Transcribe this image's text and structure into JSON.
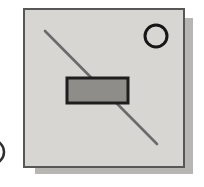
{
  "page": {
    "width": 204,
    "height": 187,
    "background_color": "#ffffff"
  },
  "icon": {
    "name": "component-symbol-icon",
    "description": "Light gray square tile with drop shadow containing a diagonal slash line, a centered dark-bordered filled rectangle, and a small outlined circle in the top-right corner; a partial arc of an adjacent glyph is clipped at the left edge of the crop",
    "tile": {
      "x": 23,
      "y": 8,
      "width": 162,
      "height": 160,
      "fill": "#d7d6d3",
      "border_color": "#575757",
      "border_width": 2.5,
      "shadow_color": "#b7b6b3",
      "shadow_offset_x": 8,
      "shadow_offset_y": 7
    },
    "slash_line": {
      "x1": 20,
      "y1": 21,
      "x2": 132,
      "y2": 134,
      "color": "#6b6b6b",
      "stroke_width": 2.6
    },
    "body_rect": {
      "x": 42,
      "y": 68,
      "width": 61,
      "height": 25,
      "fill": "#8e8d8a",
      "stroke": "#1e1e1e",
      "stroke_width": 3
    },
    "corner_circle": {
      "cx": 131,
      "cy": 26,
      "r": 11,
      "stroke": "#161616",
      "stroke_width": 3,
      "fill": "none"
    },
    "clipped_arc": {
      "cx": -8,
      "cy": 16,
      "r": 12,
      "stroke": "#2e2e2e",
      "stroke_width": 2.5,
      "fill": "none"
    }
  }
}
